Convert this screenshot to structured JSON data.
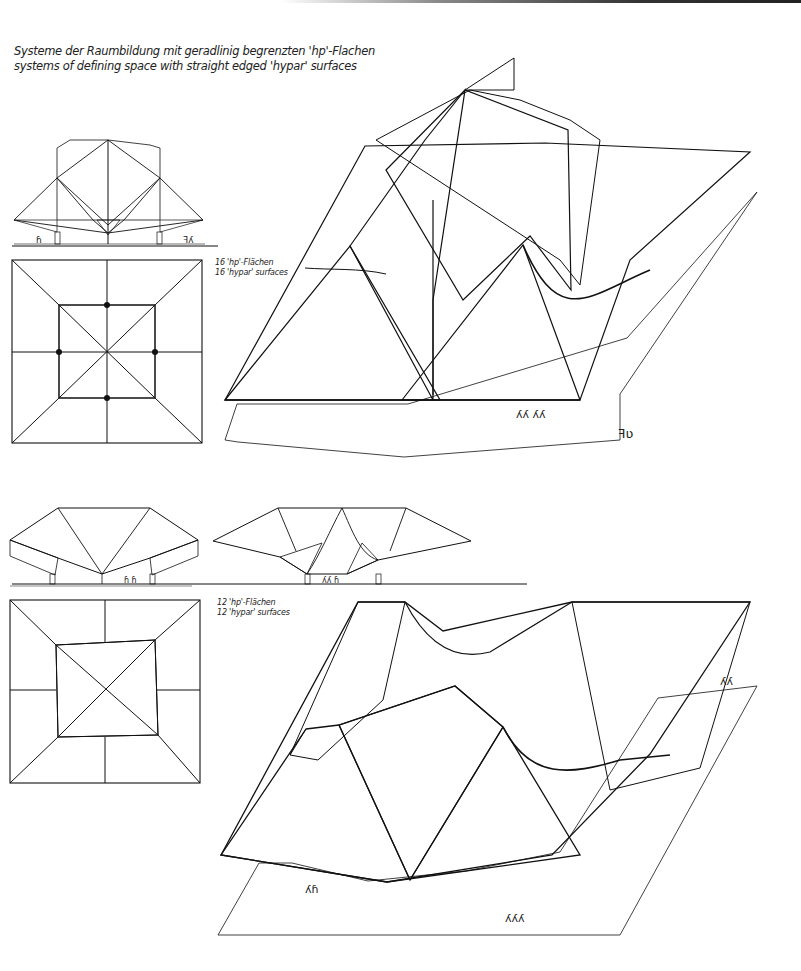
{
  "page": {
    "title_de": "Systeme der Raumbildung mit geradlinig begrenzten 'hp'-Flachen",
    "title_en": "systems of defining space with straight edged 'hypar' surfaces"
  },
  "sections": [
    {
      "id": "system-16",
      "label_de": "16 'hp'-Flächen",
      "label_en": "16 'hypar' surfaces",
      "views": [
        "elevation",
        "plan",
        "isometric"
      ]
    },
    {
      "id": "system-12",
      "label_de": "12 'hp'-Flächen",
      "label_en": "12 'hypar' surfaces",
      "views": [
        "elevation",
        "elevation",
        "plan",
        "isometric"
      ]
    }
  ],
  "colors": {
    "ink": "#111111",
    "paper": "#ffffff",
    "hatch": "#555555"
  }
}
